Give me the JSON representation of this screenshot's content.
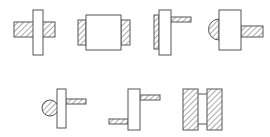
{
  "diagram": {
    "colors": {
      "stroke": "#555555",
      "fill": "#ffffff",
      "hatch": "#555555"
    },
    "figures": [
      {
        "id": 1,
        "name": "plate-through-hatched-bar",
        "parts": [
          "vertical-plate",
          "hatched-horizontal-bar"
        ]
      },
      {
        "id": 2,
        "name": "box-with-side-hatched-welds",
        "parts": [
          "central-box",
          "left-hatched-weld",
          "right-hatched-weld"
        ]
      },
      {
        "id": 3,
        "name": "plate-with-left-hatched-and-right-bar",
        "parts": [
          "vertical-plate",
          "left-hatched-weld",
          "right-hatched-bar"
        ]
      },
      {
        "id": 4,
        "name": "box-with-half-circle-and-bar",
        "parts": [
          "central-box",
          "left-hatched-half-circle",
          "right-hatched-bar"
        ]
      },
      {
        "id": 5,
        "name": "plate-with-circle-and-bar",
        "parts": [
          "vertical-plate",
          "left-hatched-circle",
          "right-hatched-bar"
        ]
      },
      {
        "id": 6,
        "name": "plate-with-offset-bars",
        "parts": [
          "vertical-plate",
          "upper-right-hatched-bar",
          "lower-left-hatched-bar"
        ]
      },
      {
        "id": 7,
        "name": "two-hatched-blocks-connected",
        "parts": [
          "left-hatched-block",
          "right-hatched-block",
          "connector"
        ]
      }
    ]
  }
}
